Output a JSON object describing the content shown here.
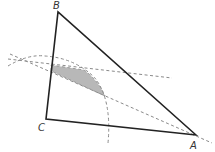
{
  "diagram": {
    "vertices": [
      {
        "name": "A",
        "label": "A"
      },
      {
        "name": "B",
        "label": "B"
      },
      {
        "name": "C",
        "label": "C"
      }
    ],
    "segments": [
      "AB",
      "BC",
      "CA"
    ],
    "construction": {
      "arc": "circular arc centered near C (dashed)",
      "lines": [
        "dashed line through A",
        "dashed near-horizontal line crossing AB"
      ],
      "shaded_region": "region inside triangle bounded by construction lines and arc"
    },
    "colors": {
      "triangle": "#222222",
      "dashed": "#8a8a8a",
      "shade": "#b8b8b8",
      "label": "#333333"
    }
  }
}
